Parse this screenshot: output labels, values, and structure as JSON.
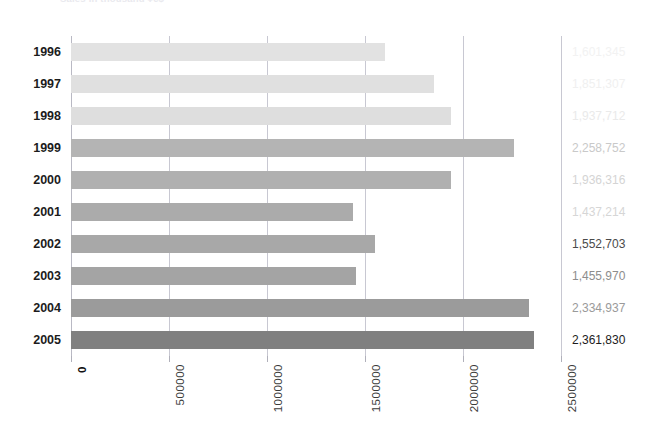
{
  "chart_data": {
    "type": "bar",
    "orientation": "horizontal",
    "title": "Sales in thousand ¥€$",
    "xlabel": "",
    "ylabel": "",
    "categories": [
      "1996",
      "1997",
      "1998",
      "1999",
      "2000",
      "2001",
      "2002",
      "2003",
      "2004",
      "2005"
    ],
    "values": [
      1601345,
      1851307,
      1937712,
      2258752,
      1936316,
      1437214,
      1552703,
      1455970,
      2334937,
      2361830
    ],
    "value_labels": [
      "1,601,345",
      "1,851,307",
      "1,937,712",
      "2,258,752",
      "1,936,316",
      "1,437,214",
      "1,552,703",
      "1,455,970",
      "2,334,937",
      "2,361,830"
    ],
    "bar_colors": [
      "#e2e2e2",
      "#e0e0e0",
      "#dedede",
      "#b4b4b4",
      "#b0b0b0",
      "#ababab",
      "#a8a8a8",
      "#a4a4a4",
      "#9b9b9b",
      "#808080"
    ],
    "label_colors": [
      "#f2f2f2",
      "#f0f0f0",
      "#eaeaea",
      "#c9c9c9",
      "#d4d4d4",
      "#d6d6d6",
      "#4a4a4a",
      "#8d8d8d",
      "#9a9a9a",
      "#1c1c1c"
    ],
    "xlim": [
      0,
      2500000
    ],
    "xticks": [
      0,
      500000,
      1000000,
      1500000,
      2000000,
      2500000
    ],
    "xtick_labels": [
      "0",
      "500000",
      "1000000",
      "1500000",
      "2000000",
      "2500000"
    ],
    "grid": true,
    "grid_axis": "x",
    "legend": false,
    "gridline_color": "#c8c8d2"
  }
}
